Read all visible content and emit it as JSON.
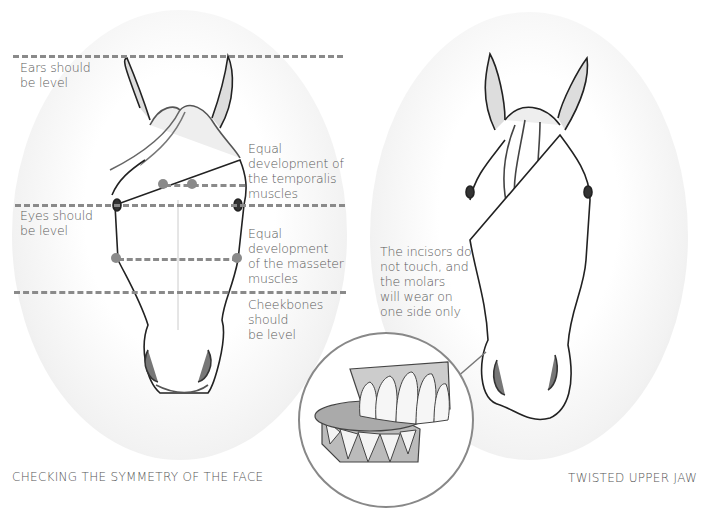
{
  "left_panel": {
    "caption": "CHECKING THE SYMMETRY OF THE FACE",
    "labels": {
      "ears": [
        "Ears should",
        "be level"
      ],
      "eyes": [
        "Eyes should",
        "be level"
      ],
      "temporalis": [
        "Equal",
        "development of",
        "the temporalis",
        "muscles"
      ],
      "masseter": [
        "Equal",
        "development",
        "of the masseter",
        "muscles"
      ],
      "cheekbones": [
        "Cheekbones",
        "should",
        "be level"
      ]
    }
  },
  "right_panel": {
    "caption": "TWISTED UPPER JAW",
    "note": [
      "The incisors do",
      "not touch, and",
      "the molars",
      "will wear on",
      "one side only"
    ]
  },
  "inset": {
    "subject": "teeth-closeup"
  },
  "colors": {
    "guide_line": "#8a8a8a",
    "text": "#5a5a5a",
    "oval_edge": "#d9d9d9",
    "inset_ring": "#888888"
  }
}
